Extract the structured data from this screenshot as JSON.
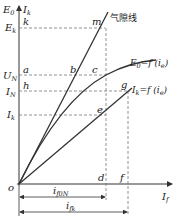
{
  "diagram": {
    "axes": {
      "y_label_main": "E",
      "y_label_main_sub": "0",
      "y_label_secondary": "I",
      "y_label_secondary_sub": "k",
      "x_label": "I",
      "x_label_sub": "f",
      "origin": "o"
    },
    "y_ticks": [
      {
        "main": "E",
        "sub": "k"
      },
      {
        "main": "U",
        "sub": "N"
      },
      {
        "main": "I",
        "sub": "N"
      },
      {
        "main": "I",
        "sub": "k"
      }
    ],
    "points": {
      "k": "k",
      "m": "m",
      "a": "a",
      "b": "b",
      "c": "c",
      "h": "h",
      "g": "g",
      "e": "e",
      "d": "d",
      "f": "f"
    },
    "curves": {
      "air_gap_line": "气隙线",
      "no_load": {
        "main": "E",
        "sub": "0",
        "eq": "=f (i",
        "arg_sub": "e",
        "close": ")"
      },
      "short_circuit": {
        "main": "I",
        "sub": "k",
        "eq": "=f (i",
        "arg_sub": "e",
        "close": ")"
      }
    },
    "dimensions": {
      "i_f0N": {
        "main": "i",
        "sub": "f0N"
      },
      "i_fk": {
        "main": "i",
        "sub": "fk"
      }
    }
  }
}
